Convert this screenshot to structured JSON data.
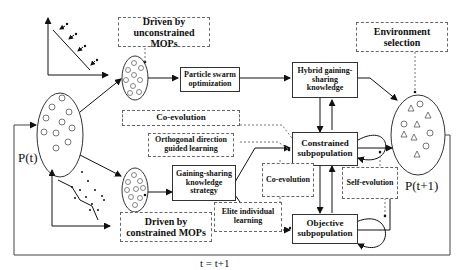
{
  "diagram": {
    "population_t": "P(t)",
    "population_t1": "P(t+1)",
    "loop_label": "t = t+1",
    "boxes": {
      "driven_unconstrained": "Driven by unconstrained MOPs",
      "particle_swarm": "Particle swarm optimization",
      "hybrid_gsk": "Hybrid gaining-sharing knowledge",
      "environment_selection": "Environment selection",
      "co_evolution_top": "Co-evolution",
      "orthogonal": "Orthogonal direction guided learning",
      "gsk_strategy": "Gaining-sharing knowledge strategy",
      "constrained_subpop": "Constrained subpopulation",
      "co_evolution_mid": "Co-evolution",
      "self_evolution": "Self-evolution",
      "elite_learning": "Elite individual learning",
      "objective_subpop": "Objective subpopulation",
      "driven_constrained": "Driven by constrained MOPs"
    }
  }
}
